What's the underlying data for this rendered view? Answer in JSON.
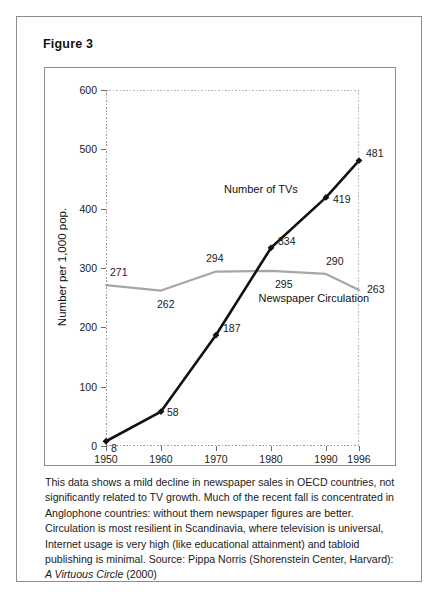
{
  "figure": {
    "title": "Figure 3",
    "caption_part1": "This data shows a mild decline in newspaper sales in OECD countries, not significantly related to TV growth. Much of the recent fall is concentrated in Anglophone countries: without them newspaper figures are better. Circulation is most resilient in Scandinavia, where television is universal, Internet usage is very high (like educational attainment) and tabloid publishing is minimal. Source: Pippa Norris (Shorenstein Center, Harvard): ",
    "caption_italic": "A Virtuous Circle",
    "caption_part2": " (2000)"
  },
  "chart_data": {
    "type": "line",
    "title": "",
    "xlabel": "",
    "ylabel": "Number per 1,000 pop.",
    "categories": [
      "1950",
      "1960",
      "1970",
      "1980",
      "1990",
      "1996"
    ],
    "x": [
      1950,
      1960,
      1970,
      1980,
      1990,
      1996
    ],
    "xlim": [
      1950,
      1996
    ],
    "ylim": [
      0,
      600
    ],
    "yticks": [
      0,
      100,
      200,
      300,
      400,
      500,
      600
    ],
    "ytick_labels": [
      "0",
      "100",
      "200",
      "300",
      "400",
      "500",
      "600"
    ],
    "grid": false,
    "legend": "inline-labels",
    "series": [
      {
        "name": "Number of TVs",
        "values": [
          8,
          58,
          187,
          334,
          419,
          481
        ],
        "color": "#111111",
        "marker": "diamond",
        "label_text": "Number of TVs"
      },
      {
        "name": "Newspaper Circulation",
        "values": [
          271,
          262,
          294,
          295,
          290,
          263
        ],
        "color": "#a6a6a6",
        "marker": "none",
        "label_text": "Newspaper Circulation"
      }
    ],
    "point_labels": {
      "tvs": [
        "8",
        "58",
        "187",
        "334",
        "419",
        "481"
      ],
      "newspapers": [
        "271",
        "262",
        "294",
        "295",
        "290",
        "263"
      ]
    }
  }
}
